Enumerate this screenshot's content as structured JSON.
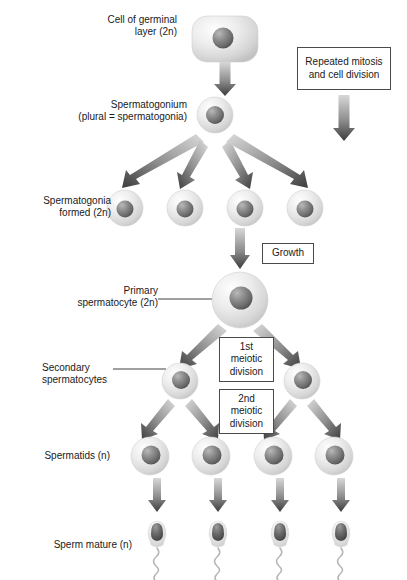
{
  "figure": {
    "background_color": "#ffffff",
    "text_color": "#1a1a1a",
    "box_border_color": "#4a4a4a",
    "arrow_color": "#5a5a5a",
    "leader_line_color": "#2b2b2b"
  },
  "labels": {
    "germinal_cell": "Cell of germinal\nlayer (2n)",
    "spermatogonium": "Spermatogonium\n(plural = spermatogonia)",
    "spermatogonia_formed": "Spermatogonia\nformed (2n)",
    "primary_spermatocyte": "Primary\nspermatocyte (2n)",
    "secondary_spermatocytes": "Secondary\nspermatocytes",
    "spermatids": "Spermatids (n)",
    "sperm_mature": "Sperm mature (n)"
  },
  "boxes": {
    "repeated_mitosis": "Repeated mitosis\nand cell division",
    "growth": "Growth",
    "first_meiotic": "1st\nmeiotic\ndivision",
    "second_meiotic": "2nd\nmeiotic\ndivision"
  },
  "stages": {
    "germinal_layer_cell": {
      "shape": "rounded-rectangle",
      "count": 1,
      "ploidy": "2n",
      "cx": 225,
      "cy": 40
    },
    "spermatogonium": {
      "shape": "circle",
      "count": 1,
      "ploidy": "2n",
      "cx": 215,
      "cy": 115,
      "r": 18
    },
    "spermatogonia": {
      "shape": "circle",
      "count": 4,
      "ploidy": "2n",
      "cy": 208,
      "r": 18,
      "cxs": [
        125,
        185,
        245,
        305
      ]
    },
    "primary_spermatocyte": {
      "shape": "circle",
      "count": 1,
      "ploidy": "2n",
      "cx": 240,
      "cy": 300,
      "r": 28
    },
    "secondary_spermatocytes": {
      "shape": "circle",
      "count": 2,
      "ploidy": "n",
      "cy": 381,
      "r": 18,
      "cxs": [
        180,
        302
      ]
    },
    "spermatids": {
      "shape": "circle",
      "count": 4,
      "ploidy": "n",
      "cy": 456,
      "r": 19,
      "cxs": [
        150,
        211,
        273,
        334
      ]
    },
    "mature_sperm": {
      "shape": "sperm",
      "count": 4,
      "ploidy": "n",
      "cy": 545,
      "cxs": [
        157,
        218,
        280,
        341
      ]
    }
  }
}
